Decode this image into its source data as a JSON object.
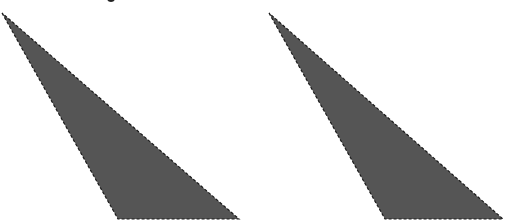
{
  "figure": {
    "background": "#ffffff",
    "fill_color": "#555555",
    "stroke_color": "#1a1a1a",
    "stroke_dash": "3,2",
    "shapes": [
      {
        "name": "triangle-left",
        "type": "polygon",
        "points": "2,13 118,219 239,219"
      },
      {
        "name": "triangle-right",
        "type": "polygon",
        "points": "269,13 385,219 503,219"
      }
    ]
  }
}
